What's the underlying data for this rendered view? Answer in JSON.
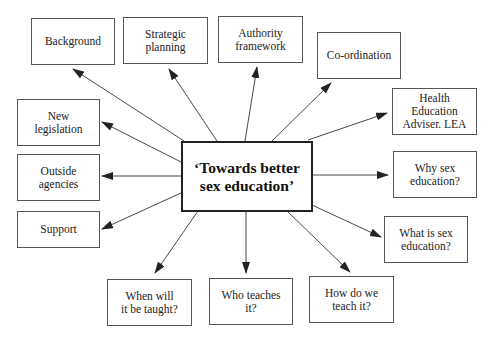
{
  "diagram": {
    "type": "mind-map",
    "center": {
      "label": "‘Towards better\nsex education’"
    },
    "nodes": [
      {
        "id": "background",
        "label": "Background"
      },
      {
        "id": "strategic-planning",
        "label": "Strategic\nplanning"
      },
      {
        "id": "authority-framework",
        "label": "Authority\nframework"
      },
      {
        "id": "co-ordination",
        "label": "Co-ordination"
      },
      {
        "id": "health-education-adviser",
        "label": "Health Education\nAdviser. LEA"
      },
      {
        "id": "new-legislation",
        "label": "New\nlegislation"
      },
      {
        "id": "outside-agencies",
        "label": "Outside\nagencies"
      },
      {
        "id": "support",
        "label": "Support"
      },
      {
        "id": "why-sex-education",
        "label": "Why sex\neducation?"
      },
      {
        "id": "what-is-sex-education",
        "label": "What is sex\neducation?"
      },
      {
        "id": "when-will-it-be-taught",
        "label": "When will\nit be taught?"
      },
      {
        "id": "who-teaches-it",
        "label": "Who teaches\nit?"
      },
      {
        "id": "how-do-we-teach-it",
        "label": "How do we\nteach it?"
      }
    ],
    "edges_direction": "center-to-node",
    "colors": {
      "line": "#333333",
      "box_border": "#555555",
      "background": "#ffffff"
    }
  }
}
